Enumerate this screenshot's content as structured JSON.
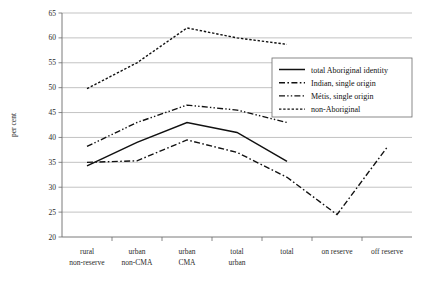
{
  "chart_data": {
    "type": "line",
    "title": "",
    "xlabel": "",
    "ylabel": "per cent",
    "ylim": [
      20,
      65
    ],
    "ytick_step": 5,
    "yticks": [
      "20",
      "25",
      "30",
      "35",
      "40",
      "45",
      "50",
      "55",
      "60",
      "65"
    ],
    "grid": true,
    "legend_position": "upper-right",
    "categories": [
      "rural non-reserve",
      "urban non-CMA",
      "urban CMA",
      "total urban",
      "total",
      "on reserve",
      "off reserve"
    ],
    "category_lines": [
      [
        "rural",
        "non-reserve"
      ],
      [
        "urban",
        "non-CMA"
      ],
      [
        "urban",
        "CMA"
      ],
      [
        "total",
        "urban"
      ],
      [
        "total",
        ""
      ],
      [
        "on reserve",
        ""
      ],
      [
        "off reserve",
        ""
      ]
    ],
    "series": [
      {
        "name": "total Aboriginal identity",
        "style": "solid",
        "values": [
          34.3,
          39.0,
          43.0,
          41.0,
          35.2,
          null,
          null
        ]
      },
      {
        "name": "Indian, single origin",
        "style": "dash-dot",
        "values": [
          35.0,
          35.3,
          39.5,
          37.0,
          32.0,
          24.5,
          38.0
        ]
      },
      {
        "name": "Métis, single origin",
        "style": "dash-dot-dot",
        "values": [
          38.2,
          43.0,
          46.5,
          45.5,
          43.0,
          null,
          null
        ]
      },
      {
        "name": "non-Aboriginal",
        "style": "dotted",
        "values": [
          49.8,
          55.0,
          62.0,
          60.0,
          58.7,
          null,
          null
        ]
      }
    ]
  },
  "legend": {
    "items": [
      {
        "label": "total Aboriginal identity"
      },
      {
        "label": "Indian, single origin"
      },
      {
        "label": "Métis, single origin"
      },
      {
        "label": "non-Aboriginal"
      }
    ]
  },
  "axis": {
    "y_title": "per cent"
  }
}
